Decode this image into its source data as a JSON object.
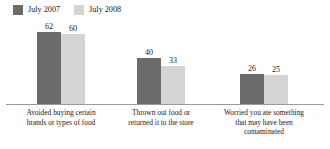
{
  "legend": {
    "position": "top-left",
    "items": [
      {
        "label": "July 2007",
        "color": "#6b6b6b",
        "swatch_name": "legend-swatch-july-2007"
      },
      {
        "label": "July 2008",
        "color": "#d4d4d4",
        "swatch_name": "legend-swatch-july-2008"
      }
    ]
  },
  "chart_data": {
    "type": "bar",
    "title": "",
    "subtitle": "",
    "xlabel": "",
    "ylabel": "",
    "ylim": [
      0,
      70
    ],
    "grid": false,
    "legend_position": "top-left",
    "categories": [
      "Avoided buying certain brands or types of food",
      "Thrown out food or returned it to the store",
      "Worried you ate something that may have been contaminated"
    ],
    "category_lines": [
      [
        "Avoided buying certain",
        "brands or types of food"
      ],
      [
        "Thrown out food or",
        "returned it to the store"
      ],
      [
        "Worried you ate something",
        "that may have been",
        "contaminated"
      ]
    ],
    "series": [
      {
        "name": "July 2007",
        "color": "#6b6b6b",
        "values": [
          62,
          40,
          26
        ]
      },
      {
        "name": "July 2008",
        "color": "#d4d4d4",
        "values": [
          60,
          33,
          25
        ]
      }
    ],
    "value_labels": [
      [
        "62",
        "60"
      ],
      [
        "40",
        "33"
      ],
      [
        "26",
        "25"
      ]
    ]
  },
  "axis": {
    "baseline_color": "#9a9a9a"
  },
  "layout": {
    "group_left_px": [
      37,
      137,
      240
    ],
    "plot_height_px": 83,
    "value_max": 70
  }
}
